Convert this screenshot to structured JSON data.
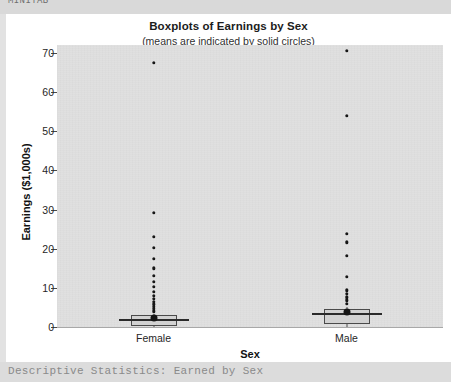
{
  "page": {
    "top_clipped_text": "MINITAB",
    "bottom_clipped_text": "Descriptive Statistics: Earned by Sex"
  },
  "chart_data": {
    "type": "boxplot",
    "title": "Boxplots of Earnings by Sex",
    "subtitle": "(means are indicated by solid circles)",
    "xlabel": "Sex",
    "ylabel": "Earnings ($1,000s)",
    "categories": [
      "Female",
      "Male"
    ],
    "ylim": [
      0,
      72
    ],
    "yticks": [
      0,
      10,
      20,
      30,
      40,
      50,
      60,
      70
    ],
    "ytick_labels": [
      "0",
      "10",
      "20",
      "30",
      "40",
      "50",
      "60",
      "70"
    ],
    "grid": false,
    "legend": "none",
    "plot_background": "#e0e0e0",
    "marker_color": "#161616",
    "series": [
      {
        "name": "Female",
        "q1": 0.8,
        "median": 1.9,
        "q3": 3.0,
        "whisker_low": 0.0,
        "whisker_high": 3.4,
        "mean": 2.3,
        "outliers": [
          4.0,
          4.6,
          5.2,
          5.8,
          6.5,
          7.2,
          8.0,
          9.0,
          10.3,
          11.6,
          13.1,
          15.0,
          17.4,
          20.2,
          23.0,
          29.2,
          67.5
        ]
      },
      {
        "name": "Male",
        "q1": 1.4,
        "median": 3.2,
        "q3": 4.6,
        "whisker_low": 0.0,
        "whisker_high": 5.2,
        "mean": 3.8,
        "outliers": [
          6.0,
          6.8,
          7.6,
          8.5,
          9.4,
          12.8,
          18.2,
          21.6,
          23.8,
          54.0,
          70.5
        ]
      }
    ]
  }
}
